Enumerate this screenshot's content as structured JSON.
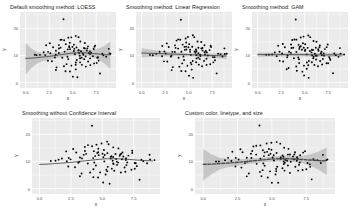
{
  "figure": {
    "background": "#ffffff",
    "panel_background": "#ebebeb",
    "grid_color": "#ffffff",
    "point_color": "#000000",
    "line_color": "#3b3b3b",
    "ribbon_color": "#bfbfbf",
    "custom_line_color": "#4d4d4d",
    "axis_text_color": "#4d4d4d",
    "title_color": "#1a1a1a"
  },
  "chart_data": [
    {
      "type": "scatter",
      "id": "loess",
      "title": "Default smoothing method: LOESS",
      "xlabel": "x",
      "ylabel": "y",
      "xlim": [
        -0.6,
        9.6
      ],
      "ylim": [
        -2.0,
        26.0
      ],
      "xticks": [
        0.0,
        2.5,
        5.0,
        7.5
      ],
      "xticklabels": [
        "0.0",
        "2.5",
        "5.0",
        "7.5"
      ],
      "yticks": [
        0,
        10,
        20
      ],
      "yticklabels": [
        "0",
        "10",
        "20"
      ],
      "grid": true,
      "legend": "none",
      "smooth_method": "loess",
      "show_confidence_interval": true,
      "linetype": "solid",
      "smooth_line": [
        [
          0.0,
          8.9
        ],
        [
          0.6,
          9.0
        ],
        [
          1.2,
          9.2
        ],
        [
          1.8,
          9.4
        ],
        [
          2.4,
          9.6
        ],
        [
          3.0,
          9.9
        ],
        [
          3.6,
          10.2
        ],
        [
          4.2,
          10.5
        ],
        [
          4.8,
          10.8
        ],
        [
          5.4,
          11.0
        ],
        [
          6.0,
          11.0
        ],
        [
          6.6,
          10.9
        ],
        [
          7.2,
          10.7
        ],
        [
          7.8,
          10.5
        ],
        [
          8.4,
          10.3
        ],
        [
          9.0,
          10.2
        ]
      ],
      "ci_upper": [
        [
          0.0,
          14.6
        ],
        [
          0.6,
          12.6
        ],
        [
          1.2,
          11.4
        ],
        [
          1.8,
          10.9
        ],
        [
          2.4,
          10.8
        ],
        [
          3.0,
          10.9
        ],
        [
          3.6,
          11.2
        ],
        [
          4.2,
          11.4
        ],
        [
          4.8,
          11.7
        ],
        [
          5.4,
          12.0
        ],
        [
          6.0,
          12.1
        ],
        [
          6.6,
          12.0
        ],
        [
          7.2,
          12.1
        ],
        [
          7.8,
          12.6
        ],
        [
          8.4,
          13.6
        ],
        [
          9.0,
          15.2
        ]
      ],
      "ci_lower": [
        [
          0.0,
          3.0
        ],
        [
          0.6,
          5.3
        ],
        [
          1.2,
          7.0
        ],
        [
          1.8,
          7.9
        ],
        [
          2.4,
          8.3
        ],
        [
          3.0,
          8.8
        ],
        [
          3.6,
          9.2
        ],
        [
          4.2,
          9.6
        ],
        [
          4.8,
          9.9
        ],
        [
          5.4,
          10.0
        ],
        [
          6.0,
          9.9
        ],
        [
          6.6,
          9.8
        ],
        [
          7.2,
          9.3
        ],
        [
          7.8,
          8.4
        ],
        [
          8.4,
          6.9
        ],
        [
          9.0,
          5.0
        ]
      ],
      "x": [
        4.1,
        2.55,
        3.9,
        4.6,
        2.4,
        5.4,
        6.1,
        5.85,
        4.35,
        7.15,
        3.2,
        5.05,
        6.6,
        4.85,
        5.55,
        2.95,
        6.95,
        5.2,
        3.55,
        7.7,
        4.45,
        6.25,
        5.7,
        3.05,
        8.1,
        4.7,
        5.95,
        6.45,
        2.8,
        7.4,
        5.35,
        4.2,
        6.8,
        3.7,
        5.6,
        7.95,
        4.95,
        6.15,
        2.65,
        5.8,
        3.35,
        7.05,
        4.55,
        6.7,
        5.1,
        8.55,
        3.85,
        6.35,
        5.45,
        2.2,
        7.25,
        4.8,
        6.05,
        3.45,
        5.25,
        8.3,
        4.3,
        6.9,
        5.9,
        2.1,
        7.55,
        4.05,
        6.55,
        3.15,
        5.65,
        8.75,
        4.65,
        6.2,
        5.0,
        1.85,
        7.8,
        4.4,
        6.75,
        3.6,
        5.75,
        9.1,
        4.9,
        6.4,
        5.15,
        1.55,
        7.6,
        4.15,
        6.0,
        3.8,
        5.5,
        2.35,
        6.65,
        4.75,
        5.3,
        8.9,
        1.2,
        7.35,
        4.25,
        6.3,
        3.25,
        5.4,
        0.95,
        6.85,
        4.5,
        5.85
      ],
      "y": [
        23.2,
        10.6,
        16.0,
        16.4,
        11.5,
        13.0,
        12.7,
        15.2,
        7.0,
        12.2,
        10.0,
        14.1,
        13.5,
        6.2,
        16.5,
        13.2,
        11.0,
        10.2,
        12.6,
        9.1,
        8.4,
        14.8,
        12.0,
        9.5,
        10.8,
        4.1,
        9.3,
        11.9,
        7.7,
        13.8,
        6.5,
        11.2,
        10.4,
        15.5,
        11.7,
        3.2,
        12.9,
        8.6,
        14.4,
        10.0,
        5.5,
        9.8,
        13.1,
        7.9,
        11.4,
        9.6,
        9.0,
        12.4,
        8.1,
        13.6,
        6.9,
        12.1,
        10.7,
        11.1,
        5.0,
        10.3,
        14.0,
        8.8,
        11.8,
        9.9,
        7.3,
        6.0,
        12.8,
        4.7,
        10.9,
        12.5,
        13.4,
        10.1,
        2.4,
        11.3,
        8.2,
        9.4,
        11.6,
        13.9,
        7.5,
        10.5,
        16.8,
        5.8,
        12.3,
        10.4,
        9.2,
        15.8,
        6.7,
        12.7,
        1.9,
        8.0,
        11.0,
        14.6,
        7.2,
        10.6,
        10.2,
        13.3,
        4.4,
        9.7,
        11.5,
        17.2,
        10.1,
        6.4,
        12.2,
        8.9
      ]
    },
    {
      "type": "scatter",
      "id": "lm",
      "title": "Smoothing method: Linear Regression",
      "xlabel": "x",
      "ylabel": "y",
      "xlim": [
        -0.6,
        9.6
      ],
      "ylim": [
        -2.0,
        26.0
      ],
      "xticks": [
        0.0,
        2.5,
        5.0,
        7.5
      ],
      "xticklabels": [
        "0.0",
        "2.5",
        "5.0",
        "7.5"
      ],
      "yticks": [
        0,
        10,
        20
      ],
      "yticklabels": [
        "0",
        "10",
        "20"
      ],
      "grid": true,
      "legend": "none",
      "smooth_method": "lm",
      "show_confidence_interval": true,
      "linetype": "solid",
      "smooth_line": [
        [
          0.0,
          10.9
        ],
        [
          9.0,
          9.8
        ]
      ],
      "ci_upper": [
        [
          0.0,
          12.6
        ],
        [
          2.0,
          11.6
        ],
        [
          4.5,
          10.9
        ],
        [
          6.5,
          10.6
        ],
        [
          9.0,
          10.9
        ]
      ],
      "ci_lower": [
        [
          0.0,
          9.2
        ],
        [
          2.0,
          9.6
        ],
        [
          4.5,
          9.8
        ],
        [
          6.5,
          9.4
        ],
        [
          9.0,
          8.7
        ]
      ]
    },
    {
      "type": "scatter",
      "id": "gam",
      "title": "Smoothing method: GAM",
      "xlabel": "x",
      "ylabel": "y",
      "xlim": [
        -0.6,
        9.6
      ],
      "ylim": [
        -2.0,
        26.0
      ],
      "xticks": [
        0.0,
        2.5,
        5.0,
        7.5
      ],
      "xticklabels": [
        "0.0",
        "2.5",
        "5.0",
        "7.5"
      ],
      "yticks": [
        0,
        10,
        20
      ],
      "yticklabels": [
        "0",
        "10",
        "20"
      ],
      "grid": true,
      "legend": "none",
      "smooth_method": "gam",
      "show_confidence_interval": true,
      "linetype": "solid",
      "smooth_line": [
        [
          0.0,
          10.3
        ],
        [
          2.0,
          10.3
        ],
        [
          4.5,
          10.3
        ],
        [
          6.5,
          10.2
        ],
        [
          9.0,
          10.2
        ]
      ],
      "ci_upper": [
        [
          0.0,
          11.1
        ],
        [
          2.0,
          11.0
        ],
        [
          4.5,
          10.9
        ],
        [
          6.5,
          10.9
        ],
        [
          9.0,
          11.0
        ]
      ],
      "ci_lower": [
        [
          0.0,
          9.5
        ],
        [
          2.0,
          9.6
        ],
        [
          4.5,
          9.7
        ],
        [
          6.5,
          9.5
        ],
        [
          9.0,
          9.4
        ]
      ]
    },
    {
      "type": "scatter",
      "id": "no-ci",
      "title": "Smoothing without Confidence Interval",
      "xlabel": "x",
      "ylabel": "y",
      "xlim": [
        -0.6,
        9.6
      ],
      "ylim": [
        -2.0,
        26.0
      ],
      "xticks": [
        0.0,
        2.5,
        5.0,
        7.5
      ],
      "xticklabels": [
        "0.0",
        "2.5",
        "5.0",
        "7.5"
      ],
      "yticks": [
        0,
        10,
        20
      ],
      "yticklabels": [
        "0",
        "10",
        "20"
      ],
      "grid": true,
      "legend": "none",
      "smooth_method": "loess",
      "show_confidence_interval": false,
      "linetype": "solid",
      "smooth_line": [
        [
          0.0,
          8.9
        ],
        [
          0.6,
          9.0
        ],
        [
          1.2,
          9.2
        ],
        [
          1.8,
          9.4
        ],
        [
          2.4,
          9.6
        ],
        [
          3.0,
          9.9
        ],
        [
          3.6,
          10.2
        ],
        [
          4.2,
          10.5
        ],
        [
          4.8,
          10.8
        ],
        [
          5.4,
          11.0
        ],
        [
          6.0,
          11.0
        ],
        [
          6.6,
          10.9
        ],
        [
          7.2,
          10.7
        ],
        [
          7.8,
          10.5
        ],
        [
          8.4,
          10.3
        ],
        [
          9.0,
          10.2
        ]
      ]
    },
    {
      "type": "scatter",
      "id": "custom",
      "title": "Custom color, linetype, and size",
      "xlabel": "x",
      "ylabel": "y",
      "xlim": [
        -0.6,
        9.6
      ],
      "ylim": [
        -2.0,
        26.0
      ],
      "xticks": [
        0.0,
        2.5,
        5.0,
        7.5
      ],
      "xticklabels": [
        "0.0",
        "2.5",
        "5.0",
        "7.5"
      ],
      "yticks": [
        0,
        10,
        20
      ],
      "yticklabels": [
        "0",
        "10",
        "20"
      ],
      "grid": true,
      "legend": "none",
      "smooth_method": "loess",
      "show_confidence_interval": true,
      "linetype": "dashed",
      "line_width": 1.4,
      "smooth_line": [
        [
          0.0,
          8.9
        ],
        [
          0.6,
          9.0
        ],
        [
          1.2,
          9.2
        ],
        [
          1.8,
          9.4
        ],
        [
          2.4,
          9.6
        ],
        [
          3.0,
          9.9
        ],
        [
          3.6,
          10.2
        ],
        [
          4.2,
          10.5
        ],
        [
          4.8,
          10.8
        ],
        [
          5.4,
          11.0
        ],
        [
          6.0,
          11.0
        ],
        [
          6.6,
          10.9
        ],
        [
          7.2,
          10.7
        ],
        [
          7.8,
          10.5
        ],
        [
          8.4,
          10.3
        ],
        [
          9.0,
          10.2
        ]
      ],
      "ci_upper": [
        [
          0.0,
          14.6
        ],
        [
          0.6,
          12.6
        ],
        [
          1.2,
          11.4
        ],
        [
          1.8,
          10.9
        ],
        [
          2.4,
          10.8
        ],
        [
          3.0,
          10.9
        ],
        [
          3.6,
          11.2
        ],
        [
          4.2,
          11.4
        ],
        [
          4.8,
          11.7
        ],
        [
          5.4,
          12.0
        ],
        [
          6.0,
          12.1
        ],
        [
          6.6,
          12.0
        ],
        [
          7.2,
          12.1
        ],
        [
          7.8,
          12.6
        ],
        [
          8.4,
          13.6
        ],
        [
          9.0,
          15.2
        ]
      ],
      "ci_lower": [
        [
          0.0,
          3.0
        ],
        [
          0.6,
          5.3
        ],
        [
          1.2,
          7.0
        ],
        [
          1.8,
          7.9
        ],
        [
          2.4,
          8.3
        ],
        [
          3.0,
          8.8
        ],
        [
          3.6,
          9.2
        ],
        [
          4.2,
          9.6
        ],
        [
          4.8,
          9.9
        ],
        [
          5.4,
          10.0
        ],
        [
          6.0,
          9.9
        ],
        [
          6.6,
          9.8
        ],
        [
          7.2,
          9.3
        ],
        [
          7.8,
          8.4
        ],
        [
          8.4,
          6.9
        ],
        [
          9.0,
          5.0
        ]
      ]
    }
  ]
}
